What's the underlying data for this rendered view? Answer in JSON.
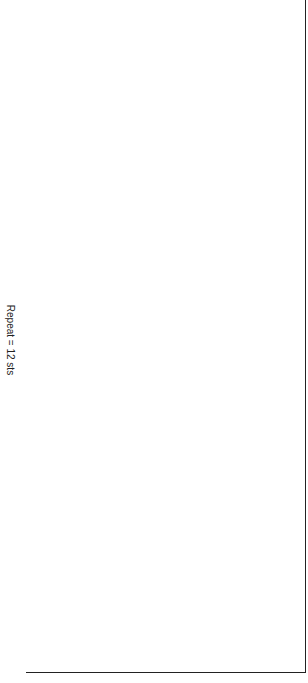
{
  "chart": {
    "repeat_label": "Repeat = 12 sts",
    "columns": 24,
    "rows": 44,
    "row_labels": [
      "1",
      "3",
      "5",
      "7",
      "9",
      "11",
      "13",
      "15",
      "17",
      "19",
      "21",
      "23"
    ],
    "thick_lines_after_row": [
      13,
      28
    ],
    "colors": {
      "shaded": "#d3d3d3",
      "empty": "#ffffff",
      "grid": "#333333"
    },
    "legend_symbols": {
      "g": "no-stitch (shaded)",
      ".": "knit (empty)",
      "p": "purl (dot)",
      "o": "yarn over (circle)",
      "/": "k2tog",
      "\\": "ssk",
      ">": "sk2p"
    },
    "grid": [
      "ggggggg.pgggggggg.pgggggg.",
      "ggggggpoogggggggpoogggggpoo",
      "gggggp.p.ggggggp.p.gggggp.p",
      "gggggpo..ggggggpo..gggggpop",
      "ggggpoo..gggggpoo..ggggpoo.p",
      "gggp.p...gggg.p.p...gggp.p.p",
      "ggp.o.o..gggp.o.....ggp.o.p.p",
      "g.poo..>.g.poo......g.poo..p.p",
      "..p..p..o...p..p......p..p..p.p",
      "..po../...po./.....p.o..p.p",
      "oo.....oo...p./..o..oo.....p.p",
      "..p...o.....p..p.......p....p.p",
      "o.......o.p..p.o..o..o.....p.p",
      "..........p..p..........p.p",
      "........................"
    ]
  }
}
